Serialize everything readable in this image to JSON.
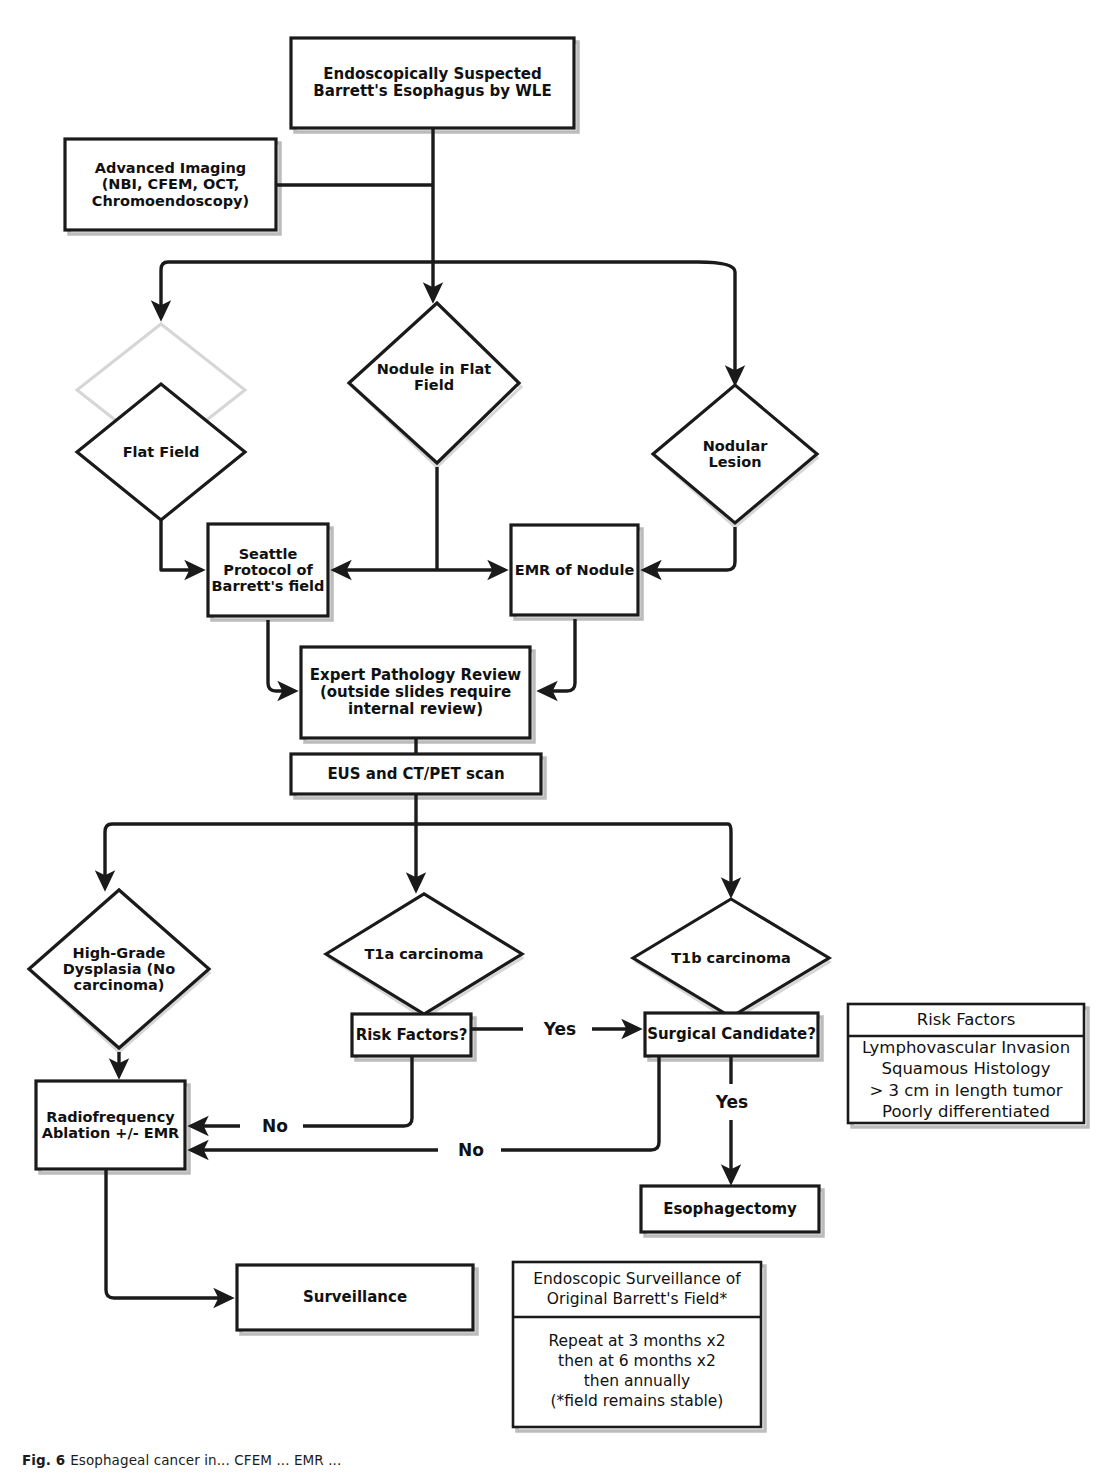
{
  "figure": {
    "caption_label": "Fig. 6",
    "caption_text": "Esophageal cancer in... CFEM ... EMR ..."
  },
  "nodes": {
    "start": {
      "id": "start",
      "shape": "rect",
      "label": "Endoscopically Suspected\nBarrett's Esophagus by WLE",
      "x": 291,
      "y": 38,
      "w": 283,
      "h": 90,
      "font": 15
    },
    "advanced_imaging": {
      "id": "advanced-imaging",
      "shape": "rect",
      "label": "Advanced Imaging\n(NBI, CFEM, OCT,\nChromoendoscopy)",
      "x": 65,
      "y": 139,
      "w": 211,
      "h": 91,
      "font": 14.5
    },
    "flat_field": {
      "id": "flat-field",
      "shape": "diamond",
      "label": "Flat Field",
      "x": 77,
      "y": 384,
      "w": 168,
      "h": 136,
      "font": 14.5
    },
    "nodule_in_flat_field": {
      "id": "nodule-in-flat-field",
      "shape": "diamond",
      "label": "Nodule in Flat\nField",
      "x": 349,
      "y": 303,
      "w": 170,
      "h": 160,
      "font": 14.5
    },
    "nodular_lesion": {
      "id": "nodular-lesion",
      "shape": "diamond",
      "label": "Nodular\nLesion",
      "x": 653,
      "y": 385,
      "w": 164,
      "h": 138,
      "font": 14.5
    },
    "seattle_protocol": {
      "id": "seattle-protocol",
      "shape": "rect",
      "label": "Seattle\nProtocol of\nBarrett's field",
      "x": 208,
      "y": 524,
      "w": 120,
      "h": 92,
      "font": 14.5
    },
    "emr_of_nodule": {
      "id": "emr-of-nodule",
      "shape": "rect",
      "label": "EMR of Nodule",
      "x": 511,
      "y": 525,
      "w": 127,
      "h": 90,
      "font": 14.5
    },
    "expert_pathology": {
      "id": "expert-pathology-review",
      "shape": "rect",
      "label": "Expert Pathology Review\n(outside slides require\ninternal review)",
      "x": 301,
      "y": 647,
      "w": 229,
      "h": 91,
      "font": 15
    },
    "eus_ct_pet": {
      "id": "eus-and-ct-pet-scan",
      "shape": "rect",
      "label": "EUS and CT/PET scan",
      "x": 291,
      "y": 754,
      "w": 250,
      "h": 40,
      "font": 15
    },
    "hgd": {
      "id": "high-grade-dysplasia",
      "shape": "diamond",
      "label": "High-Grade\nDysplasia (No\ncarcinoma)",
      "x": 29,
      "y": 890,
      "w": 180,
      "h": 158,
      "font": 14.5
    },
    "t1a": {
      "id": "t1a-carcinoma",
      "shape": "diamond",
      "label": "T1a carcinoma",
      "x": 326,
      "y": 894,
      "w": 196,
      "h": 120,
      "font": 14.5
    },
    "t1b": {
      "id": "t1b-carcinoma",
      "shape": "diamond",
      "label": "T1b carcinoma",
      "x": 633,
      "y": 899,
      "w": 196,
      "h": 118,
      "font": 14.5
    },
    "risk_factors_q": {
      "id": "risk-factors-question",
      "shape": "rect",
      "label": "Risk Factors?",
      "x": 352,
      "y": 1014,
      "w": 119,
      "h": 42,
      "font": 15
    },
    "surgical_candidate_q": {
      "id": "surgical-candidate-question",
      "shape": "rect",
      "label": "Surgical Candidate?",
      "x": 645,
      "y": 1013,
      "w": 173,
      "h": 43,
      "font": 15
    },
    "rfa": {
      "id": "radiofrequency-ablation",
      "shape": "rect",
      "label": "Radiofrequency\nAblation +/- EMR",
      "x": 36,
      "y": 1081,
      "w": 149,
      "h": 88,
      "font": 14.5
    },
    "esophagectomy": {
      "id": "esophagectomy",
      "shape": "rect",
      "label": "Esophagectomy",
      "x": 641,
      "y": 1186,
      "w": 178,
      "h": 46,
      "font": 15
    },
    "surveillance": {
      "id": "surveillance",
      "shape": "rect",
      "label": "Surveillance",
      "x": 237,
      "y": 1265,
      "w": 236,
      "h": 65,
      "font": 15
    }
  },
  "edge_labels": [
    {
      "id": "edge-label-yes-t1a",
      "text": "Yes",
      "x": 530,
      "y": 1022,
      "w": 60,
      "h": 26
    },
    {
      "id": "edge-label-yes-surgical",
      "text": "Yes",
      "x": 702,
      "y": 1090,
      "w": 60,
      "h": 26
    },
    {
      "id": "edge-label-no-risk-factors",
      "text": "No",
      "x": 245,
      "y": 1110,
      "w": 60,
      "h": 26
    },
    {
      "id": "edge-label-no-surgical",
      "text": "No",
      "x": 443,
      "y": 1134,
      "w": 60,
      "h": 26
    }
  ],
  "legends": {
    "risk_factors": {
      "id": "risk-factors-legend",
      "x": 848,
      "y": 1004,
      "w": 236,
      "h": 119,
      "header": "Risk Factors",
      "header_h": 32,
      "body": "Lymphovascular Invasion\nSquamous Histology\n> 3 cm in length tumor\nPoorly differentiated",
      "font": 16.5
    },
    "surveillance": {
      "id": "endoscopic-surveillance-legend",
      "x": 513,
      "y": 1262,
      "w": 248,
      "h": 165,
      "header": "Endoscopic Surveillance of\nOriginal Barrett's Field*",
      "header_h": 55,
      "body": "Repeat at 3 months x2\nthen at 6 months x2\nthen annually\n(*field remains stable)",
      "font": 15.5
    }
  },
  "colors": {
    "stroke": "#1a1a1a",
    "background": "#ffffff",
    "shadow": "#b9b9b9",
    "text": "#111111"
  }
}
